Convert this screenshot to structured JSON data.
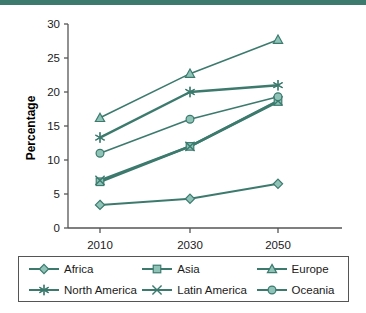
{
  "figure": {
    "accent_color": "#3c7a6e",
    "axis_color": "#555555",
    "text_color": "#1a1a1a",
    "top_rule": "decorative-green-band"
  },
  "chart_data": {
    "type": "line",
    "title": "",
    "subtitle": "",
    "xlabel": "",
    "ylabel": "Percentage",
    "x": [
      "2010",
      "2030",
      "2050"
    ],
    "categories": [
      "2010",
      "2030",
      "2050"
    ],
    "ylim": [
      0,
      30
    ],
    "yticks": [
      0,
      5,
      10,
      15,
      20,
      25,
      30
    ],
    "ytick_labels": [
      "0",
      "5",
      "10",
      "15",
      "20",
      "25",
      "30"
    ],
    "grid": false,
    "legend_position": "bottom",
    "series": [
      {
        "name": "Africa",
        "marker": "diamond",
        "values": [
          3.4,
          4.3,
          6.5
        ]
      },
      {
        "name": "Asia",
        "marker": "square",
        "values": [
          6.8,
          12.0,
          18.6
        ]
      },
      {
        "name": "Europe",
        "marker": "triangle",
        "values": [
          16.2,
          22.7,
          27.7
        ]
      },
      {
        "name": "North America",
        "marker": "star",
        "values": [
          13.3,
          20.0,
          21.0
        ]
      },
      {
        "name": "Latin America",
        "marker": "x",
        "values": [
          7.0,
          12.0,
          18.7
        ]
      },
      {
        "name": "Oceania",
        "marker": "circle",
        "values": [
          11.0,
          16.0,
          19.3
        ]
      }
    ]
  },
  "legend": {
    "items": [
      {
        "label": "Africa",
        "marker": "diamond"
      },
      {
        "label": "Asia",
        "marker": "square"
      },
      {
        "label": "Europe",
        "marker": "triangle"
      },
      {
        "label": "North America",
        "marker": "star"
      },
      {
        "label": "Latin America",
        "marker": "x"
      },
      {
        "label": "Oceania",
        "marker": "circle"
      }
    ]
  }
}
